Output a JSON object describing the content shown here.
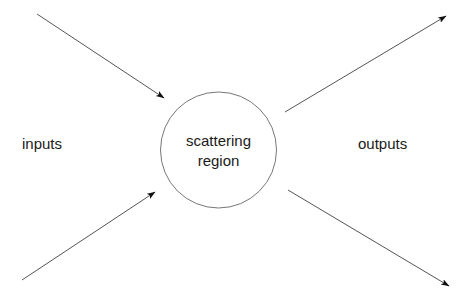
{
  "diagram": {
    "background_color": "#ffffff",
    "stroke_color": "#555555",
    "arrowhead_color": "#111111",
    "text_color": "#1a1a1a",
    "labels": {
      "inputs": "inputs",
      "outputs": "outputs",
      "region_line_1": "scattering",
      "region_line_2": "region"
    },
    "node": {
      "name": "scattering-region",
      "shape": "circle",
      "center_x": 218,
      "center_y": 150,
      "radius": 58
    },
    "arrows": [
      {
        "name": "input-arrow-top",
        "direction": "inbound",
        "from_x": 37,
        "from_y": 14,
        "to_x": 167,
        "to_y": 100
      },
      {
        "name": "input-arrow-bottom",
        "direction": "inbound",
        "from_x": 22,
        "from_y": 280,
        "to_x": 158,
        "to_y": 190
      },
      {
        "name": "output-arrow-top",
        "direction": "outbound",
        "from_x": 285,
        "from_y": 112,
        "to_x": 449,
        "to_y": 14
      },
      {
        "name": "output-arrow-bottom",
        "direction": "outbound",
        "from_x": 288,
        "from_y": 190,
        "to_x": 452,
        "to_y": 288
      }
    ]
  }
}
